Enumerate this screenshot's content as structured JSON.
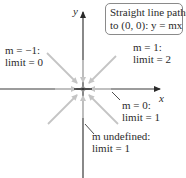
{
  "callout": {
    "line1": "Straight line paths",
    "line2": "to (0, 0): y = mx"
  },
  "axes": {
    "x_label": "x",
    "y_label": "y"
  },
  "paths": [
    {
      "slope": "m = −1:",
      "limit": "limit = 0",
      "direction": "upper-left to origin"
    },
    {
      "slope": "m = 1:",
      "limit": "limit = 2",
      "direction": "upper-right to origin"
    },
    {
      "slope": "m = 0:",
      "limit": "limit = 1",
      "direction": "along x-axis"
    },
    {
      "slope": "m undefined:",
      "limit": "limit = 1",
      "direction": "along y-axis"
    }
  ],
  "colors": {
    "axis": "#3a3a3a",
    "arrow": "#c4c4c4",
    "leader": "#3a3a3a",
    "callout_border": "#8a8a8a"
  }
}
